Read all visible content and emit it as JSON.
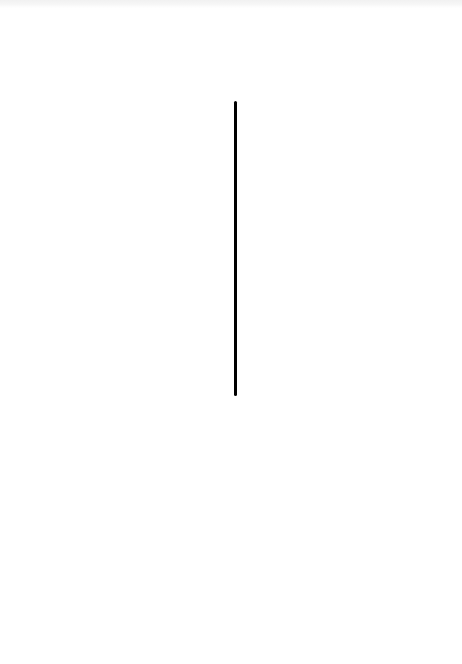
{
  "top_strip": {
    "legible_text": ""
  },
  "drawing": {
    "background_color": "#ffffff",
    "stroke": {
      "shape": "vertical-line",
      "color": "#000000",
      "x": 234,
      "y_start": 101,
      "y_end": 396,
      "width": 3
    }
  }
}
